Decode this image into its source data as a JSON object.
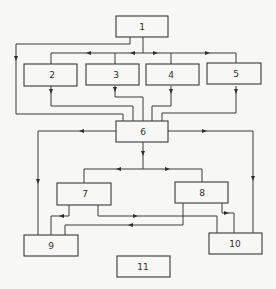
{
  "diagram": {
    "type": "block flow diagram",
    "colors": {
      "background": "#f7f7f5",
      "stroke": "#3a3a3a",
      "text": "#2e2e2e"
    },
    "blocks": [
      {
        "id": "1",
        "label": "1"
      },
      {
        "id": "2",
        "label": "2"
      },
      {
        "id": "3",
        "label": "3"
      },
      {
        "id": "4",
        "label": "4"
      },
      {
        "id": "5",
        "label": "5"
      },
      {
        "id": "6",
        "label": "6"
      },
      {
        "id": "7",
        "label": "7"
      },
      {
        "id": "8",
        "label": "8"
      },
      {
        "id": "9",
        "label": "9"
      },
      {
        "id": "10",
        "label": "10"
      },
      {
        "id": "11",
        "label": "11"
      }
    ],
    "connections": [
      {
        "from": "1",
        "to": "2"
      },
      {
        "from": "1",
        "to": "3"
      },
      {
        "from": "1",
        "to": "4"
      },
      {
        "from": "1",
        "to": "5"
      },
      {
        "from": "1",
        "to": "6"
      },
      {
        "from": "2",
        "to": "6"
      },
      {
        "from": "3",
        "to": "6"
      },
      {
        "from": "4",
        "to": "6"
      },
      {
        "from": "5",
        "to": "6"
      },
      {
        "from": "6",
        "to": "7"
      },
      {
        "from": "6",
        "to": "8"
      },
      {
        "from": "6",
        "to": "9"
      },
      {
        "from": "6",
        "to": "10"
      },
      {
        "from": "7",
        "to": "9"
      },
      {
        "from": "7",
        "to": "10"
      },
      {
        "from": "8",
        "to": "9"
      },
      {
        "from": "8",
        "to": "10"
      }
    ]
  }
}
